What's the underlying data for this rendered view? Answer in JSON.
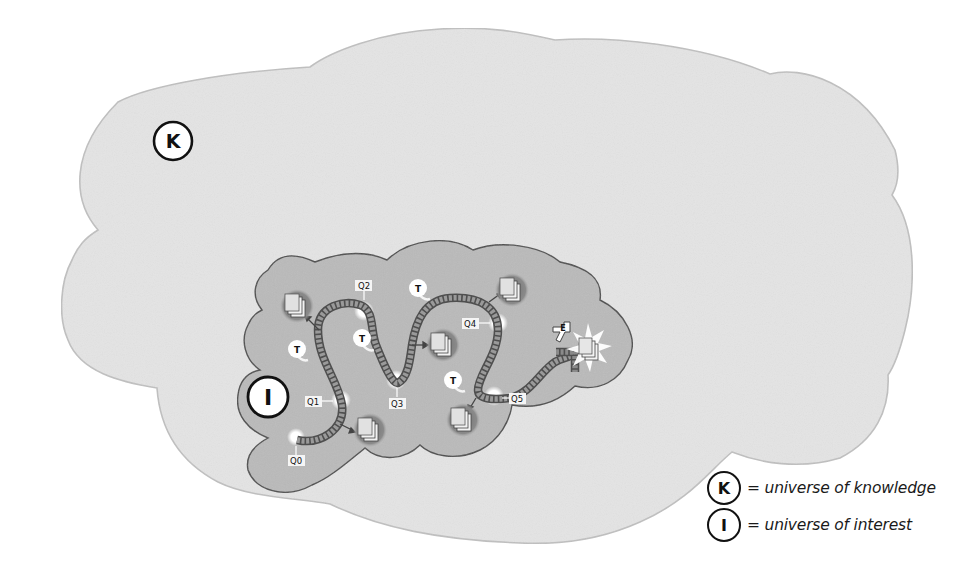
{
  "diagram": {
    "type": "concept-diagram",
    "colors": {
      "background": "#ffffff",
      "outer_cloud_fill": "#e6e6e6",
      "outer_cloud_stroke": "#bdbdbd",
      "inner_cloud_fill": "#bcbcbc",
      "inner_cloud_stroke": "#5a5a5a",
      "path_fill": "#8a8a8a",
      "path_stroke": "#555555",
      "label_bg": "#ffffff",
      "text": "#111111"
    },
    "regions": {
      "outer": {
        "symbol": "K",
        "meaning": "universe of knowledge"
      },
      "inner": {
        "symbol": "I",
        "meaning": "universe of interest"
      }
    },
    "query_labels": [
      "Q0",
      "Q1",
      "Q2",
      "Q3",
      "Q4",
      "Q5"
    ],
    "topic_label": "T",
    "topic_count": 5,
    "document_stack_count": 5,
    "end_marker": "E"
  },
  "legend": {
    "items": [
      {
        "symbol": "K",
        "text": "= universe of knowledge"
      },
      {
        "symbol": "I",
        "text": "= universe of interest"
      }
    ]
  }
}
